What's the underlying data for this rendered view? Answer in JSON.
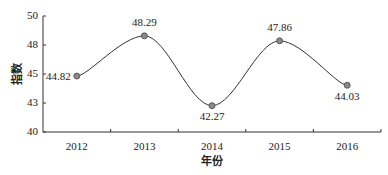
{
  "chart_data": {
    "type": "line",
    "smooth": true,
    "categories": [
      "2012",
      "2013",
      "2014",
      "2015",
      "2016"
    ],
    "values": [
      44.82,
      48.29,
      42.27,
      47.86,
      44.03
    ],
    "data_labels": [
      "44.82",
      "48.29",
      "42.27",
      "47.86",
      "44.03"
    ],
    "title": "",
    "xlabel": "年份",
    "ylabel": "指数",
    "ylim": [
      40,
      50
    ],
    "yticks": [
      40,
      42.5,
      45,
      47.5,
      50
    ],
    "ytick_labels": [
      "40",
      "43",
      "45",
      "48",
      "50"
    ],
    "grid": false,
    "legend": null,
    "colors": {
      "line": "#333333",
      "marker": "#8a8a8a",
      "marker_edge": "#444444",
      "axis": "#333333"
    }
  }
}
